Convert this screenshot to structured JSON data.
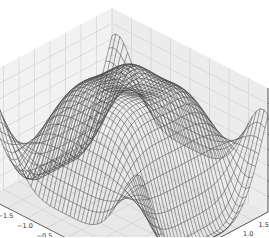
{
  "chart_data": {
    "type": "surface-wireframe-3d",
    "title": "",
    "xlabel": "",
    "ylabel": "",
    "zlabel": "",
    "x_ticks": [
      "-2.0",
      "-1.5",
      "-1.0",
      "-0.5",
      "0.0",
      "0.5",
      "1.0",
      "1.5",
      "2.0"
    ],
    "y_ticks": [
      "-1.5",
      "-1.0",
      "-0.5",
      "0.0",
      "0.5",
      "1.0",
      "1.5"
    ],
    "z_ticks": [
      "0.75",
      "0.50",
      "0.25",
      "0.00",
      "-0.25",
      "-0.50",
      "-0.75"
    ],
    "xlim": [
      -2.0,
      2.0
    ],
    "ylim": [
      -2.0,
      2.0
    ],
    "zlim": [
      -1.0,
      1.0
    ],
    "grid": true,
    "legend": null,
    "wire_color": "#404040",
    "pane_color": "#f2f2f2",
    "grid_color": "#cccccc",
    "surface_description": "Wireframe surface: broad high plateau near z≈0.9 across the center with a central depression, steep dips to z≈-1 near the x=±1.5 edges, and rising edges back toward z≈0.9 at x=±2; a narrow peak at the back edge."
  },
  "header": {
    "faint_text": ""
  }
}
